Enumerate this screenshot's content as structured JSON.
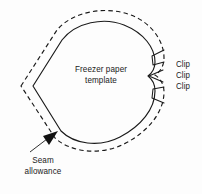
{
  "figure": {
    "kind": "sewing-template-diagram",
    "background_color": "#fdfdfd",
    "ink_color": "#1a1a1a"
  },
  "labels": {
    "template": {
      "line1": "Freezer paper",
      "line2": "template"
    },
    "seam": {
      "line1": "Seam",
      "line2": "allowance"
    },
    "clips": [
      "Clip",
      "Clip",
      "Clip"
    ]
  },
  "annotations": {
    "seam_arrow": "arrow-pointing-up-right",
    "clip_notches_count": 3
  }
}
